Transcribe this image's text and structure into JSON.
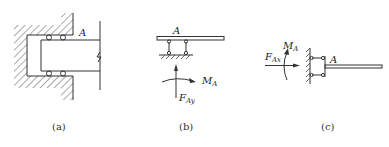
{
  "figure": {
    "panels": [
      {
        "id": "a",
        "caption": "(a)",
        "point_label": "A",
        "description": "Sliding (roller) fixed support: beam end inserted into wall slot with two rollers above and two below"
      },
      {
        "id": "b",
        "caption": "(b)",
        "point_label": "A",
        "force_label": "F",
        "force_subscript": "Ay",
        "moment_label": "M",
        "moment_subscript": "A",
        "description": "Horizontal beam on two-link support; reaction force vertical and moment"
      },
      {
        "id": "c",
        "caption": "(c)",
        "point_label": "A",
        "force_label": "F",
        "force_subscript": "Ax",
        "moment_label": "M",
        "moment_subscript": "A",
        "description": "Beam attached to vertical wall via two horizontal links; reaction force horizontal and moment"
      }
    ]
  }
}
